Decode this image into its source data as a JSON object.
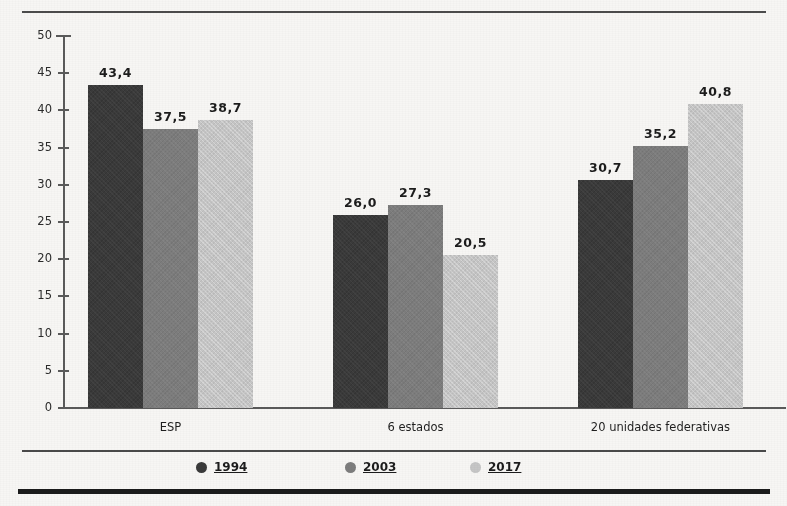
{
  "chart_data": {
    "type": "bar",
    "title": "",
    "xlabel": "",
    "ylabel": "",
    "ylim": [
      0,
      50
    ],
    "ytick_step": 5,
    "yticks": [
      "0",
      "5",
      "10",
      "15",
      "20",
      "25",
      "30",
      "35",
      "40",
      "45",
      "50"
    ],
    "grid": false,
    "legend_position": "bottom",
    "categories": [
      "ESP",
      "6 estados",
      "20 unidades federativas"
    ],
    "series": [
      {
        "name": "1994",
        "color": "#3a3a3a",
        "values": [
          43.4,
          26.0,
          30.7
        ],
        "labels": [
          "43,4",
          "26,0",
          "30,7"
        ]
      },
      {
        "name": "2003",
        "color": "#7d7d7d",
        "values": [
          37.5,
          27.3,
          35.2
        ],
        "labels": [
          "37,5",
          "27,3",
          "35,2"
        ]
      },
      {
        "name": "2017",
        "color": "#c6c6c6",
        "values": [
          38.7,
          20.5,
          40.8
        ],
        "labels": [
          "38,7",
          "20,5",
          "40,8"
        ]
      }
    ]
  },
  "legend": {
    "items": [
      {
        "label": "1994",
        "color": "#3a3a3a"
      },
      {
        "label": "2003",
        "color": "#7d7d7d"
      },
      {
        "label": "2017",
        "color": "#c6c6c6"
      }
    ]
  },
  "footer": {
    "clipped_caption": ""
  }
}
